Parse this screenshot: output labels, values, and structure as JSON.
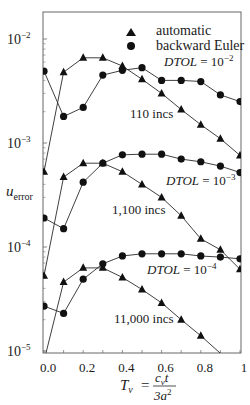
{
  "chart_data": {
    "type": "line",
    "title": "",
    "xlabel": "T_v = c_v t / 3a^2",
    "ylabel": "u_error",
    "yscale": "log",
    "xlim": [
      0,
      1
    ],
    "ylim": [
      1e-05,
      0.016
    ],
    "grid": false,
    "legend_position": "upper right (inside)",
    "x_ticks": [
      "0.0",
      "0.2",
      "0.4",
      "0.6",
      "0.8",
      "1"
    ],
    "y_ticks": [
      {
        "base": "10",
        "exp": "−2",
        "value": 0.01
      },
      {
        "base": "10",
        "exp": "−3",
        "value": 0.001
      },
      {
        "base": "10",
        "exp": "−4",
        "value": 0.0001
      },
      {
        "base": "10",
        "exp": "−5",
        "value": 1e-05
      }
    ],
    "legend": [
      {
        "marker": "triangle",
        "label": "automatic"
      },
      {
        "marker": "circle",
        "label": "backward Euler"
      }
    ],
    "x": [
      0.0,
      0.1,
      0.2,
      0.3,
      0.4,
      0.5,
      0.6,
      0.7,
      0.8,
      0.9,
      1.0
    ],
    "groups": [
      {
        "dtol_prefix": "DTOL",
        "dtol_eq": " = 10",
        "dtol_exp": "−2",
        "incs_label": "110 incs",
        "series": [
          {
            "name": "automatic",
            "marker": "triangle",
            "values": [
              0.00053,
              0.0048,
              0.0066,
              0.0066,
              0.0055,
              0.0041,
              0.003,
              0.0021,
              0.0015,
              0.0011,
              0.00076
            ]
          },
          {
            "name": "backward Euler",
            "marker": "circle",
            "values": [
              0.0049,
              0.0018,
              0.0022,
              0.0045,
              0.005,
              0.0053,
              0.004,
              0.004,
              0.0039,
              0.0029,
              0.0025
            ]
          }
        ]
      },
      {
        "dtol_prefix": "DTOL",
        "dtol_eq": " = 10",
        "dtol_exp": "−3",
        "incs_label": "1,100 incs",
        "series": [
          {
            "name": "automatic",
            "marker": "triangle",
            "values": [
              5.3e-05,
              0.00047,
              0.00064,
              0.00064,
              0.00053,
              0.0004,
              0.0003,
              0.0002,
              0.00012,
              9.4e-05,
              6.1e-05
            ]
          },
          {
            "name": "backward Euler",
            "marker": "circle",
            "values": [
              0.00019,
              0.00015,
              0.00042,
              0.00064,
              0.00077,
              0.00078,
              0.00078,
              0.0007,
              0.00066,
              0.0006,
              0.00052
            ]
          }
        ]
      },
      {
        "dtol_prefix": "DTOL",
        "dtol_eq": " = 10",
        "dtol_exp": "−4",
        "incs_label": "11,000 incs",
        "series": [
          {
            "name": "automatic",
            "marker": "triangle",
            "values": [
              8e-06,
              4.6e-05,
              6.3e-05,
              6.3e-05,
              5.1e-05,
              3.9e-05,
              2.9e-05,
              2e-05,
              1.4e-05,
              9.5e-06,
              7e-06
            ]
          },
          {
            "name": "backward Euler",
            "marker": "circle",
            "values": [
              2.7e-05,
              2.3e-05,
              4.9e-05,
              6.9e-05,
              8.2e-05,
              8.6e-05,
              8.6e-05,
              8.6e-05,
              8.2e-05,
              8e-05,
              7.7e-05
            ]
          }
        ]
      }
    ]
  },
  "labels": {
    "ylabel_main": "u",
    "ylabel_sub": "error",
    "xlabel_lhs": "T",
    "xlabel_lhs_sub": "v",
    "xlabel_eq": "=",
    "xlabel_num": "c",
    "xlabel_num_sub": "v",
    "xlabel_num_t": "t",
    "xlabel_den": "3a",
    "xlabel_den_sup": "2"
  },
  "colors": {
    "line": "#2a2a2a",
    "marker": "#111111",
    "axis": "#555555",
    "background": "#ffffff"
  }
}
